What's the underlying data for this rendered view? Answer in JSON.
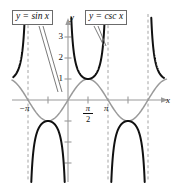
{
  "figure": {
    "background_color": "#ffffff"
  },
  "labels": {
    "sin_box": "y = sin x",
    "csc_box": "y = csc x",
    "x_axis_name": "x",
    "y_axis_name": "y"
  },
  "ticks": {
    "y": [
      "1",
      "2",
      "3"
    ],
    "y1": "1",
    "y2": "2",
    "y3": "3",
    "x_neg_pi": "−π",
    "x_pi": "π",
    "x_pi_over_2_num": "π",
    "x_pi_over_2_den": "2"
  },
  "colors": {
    "sine_curve": "#9a9a9a",
    "cosecant_curve": "#111111",
    "axis": "#9a9a9a",
    "asymptote": "#9a9a9a",
    "callout_border": "#6b6b6b",
    "text": "#111111"
  },
  "chart_data": {
    "type": "line",
    "xlabel": "x",
    "ylabel": "y",
    "xlim": [
      -4.2,
      8.0
    ],
    "ylim": [
      -4.5,
      4.6
    ],
    "grid": false,
    "legend_position": "inside-top",
    "x_ticks": [
      -3.14159,
      -1.5708,
      1.5708,
      3.14159,
      4.712,
      6.283
    ],
    "x_tick_labels": [
      "−π",
      "",
      "π/2",
      "π",
      "",
      ""
    ],
    "y_ticks": [
      -3,
      -2,
      -1,
      1,
      2,
      3
    ],
    "y_tick_labels": [
      "",
      "",
      "",
      "1",
      "2",
      "3"
    ],
    "asymptotes_x": [
      -3.14159,
      0,
      3.14159,
      6.28319
    ],
    "series": [
      {
        "name": "y = sin x",
        "color": "#9a9a9a",
        "style": "solid-light",
        "description": "Sine wave, amplitude 1, period 2π, zeros at -π, 0, π, 2π; maximum 1 at π/2; minimum -1 at -π/2 and 3π/2"
      },
      {
        "name": "y = csc x",
        "color": "#111111",
        "style": "solid-bold",
        "description": "Cosecant branches with vertical asymptotes at multiples of π; minimum value 1 at π/2; maximum value -1 at -π/2 and 3π/2"
      }
    ],
    "annotations": [
      {
        "text": "y = sin x",
        "points_to": "sine curve"
      },
      {
        "text": "y = csc x",
        "points_to": "cosecant branch"
      }
    ]
  }
}
